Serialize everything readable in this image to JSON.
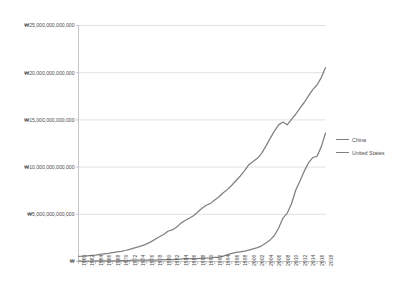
{
  "chart_data": {
    "type": "line",
    "title": "",
    "xlabel": "",
    "ylabel": "",
    "grid": true,
    "legend_position": "right",
    "currency_symbol": "₩",
    "ylim": [
      0,
      25000000000000
    ],
    "ytick_labels": [
      "₩25,000,000,000,000",
      "₩20,000,000,000,000",
      "₩15,000,000,000,000",
      "₩10,000,000,000,000",
      "₩5,000,000,000,000",
      "₩"
    ],
    "ytick_values": [
      25000000000000,
      20000000000000,
      15000000000000,
      10000000000000,
      5000000000000,
      0
    ],
    "xlim": [
      1960,
      2018
    ],
    "xtick_labels": [
      "1960",
      "1962",
      "1964",
      "1966",
      "1968",
      "1970",
      "1972",
      "1974",
      "1976",
      "1978",
      "1980",
      "1982",
      "1984",
      "1986",
      "1988",
      "1990",
      "1992",
      "1994",
      "1996",
      "1998",
      "2000",
      "2002",
      "2004",
      "2006",
      "2008",
      "2010",
      "2012",
      "2014",
      "2016",
      "2018"
    ],
    "x": [
      1960,
      1961,
      1962,
      1963,
      1964,
      1965,
      1966,
      1967,
      1968,
      1969,
      1970,
      1971,
      1972,
      1973,
      1974,
      1975,
      1976,
      1977,
      1978,
      1979,
      1980,
      1981,
      1982,
      1983,
      1984,
      1985,
      1986,
      1987,
      1988,
      1989,
      1990,
      1991,
      1992,
      1993,
      1994,
      1995,
      1996,
      1997,
      1998,
      1999,
      2000,
      2001,
      2002,
      2003,
      2004,
      2005,
      2006,
      2007,
      2008,
      2009,
      2010,
      2011,
      2012,
      2013,
      2014,
      2015,
      2016,
      2017,
      2018
    ],
    "series": [
      {
        "name": "China",
        "color": "#808080",
        "values": [
          59700000000,
          50100000000,
          47200000000,
          50700000000,
          59700000000,
          70400000000,
          76700000000,
          72900000000,
          70800000000,
          79700000000,
          92600000000,
          99800000000,
          113700000000,
          138500000000,
          144200000000,
          163400000000,
          153900000000,
          174900000000,
          149500000000,
          178300000000,
          191100000000,
          195900000000,
          205100000000,
          230700000000,
          259900000000,
          309500000000,
          300800000000,
          272900000000,
          312400000000,
          347800000000,
          360900000000,
          383400000000,
          426900000000,
          444700000000,
          564300000000,
          734500000000,
          863700000000,
          961600000000,
          1025300000000,
          1089500000000,
          1211300000000,
          1339400000000,
          1470600000000,
          1660300000000,
          1955300000000,
          2285900000000,
          2752100000000,
          3550300000000,
          4594300000000,
          5101700000000,
          6087200000000,
          7551500000000,
          8532200000000,
          9570400000000,
          10438500000000,
          11015500000000,
          11137900000000,
          12143500000000,
          13608200000000
        ]
      },
      {
        "name": "United States",
        "color": "#808080",
        "values": [
          543300000000,
          563300000000,
          605100000000,
          638600000000,
          685800000000,
          743700000000,
          815000000000,
          861700000000,
          942500000000,
          1019900000000,
          1073300000000,
          1164900000000,
          1279100000000,
          1425400000000,
          1545200000000,
          1684900000000,
          1873400000000,
          2081800000000,
          2351600000000,
          2627300000000,
          2857300000000,
          3207000000000,
          3343800000000,
          3634000000000,
          4037600000000,
          4339000000000,
          4579600000000,
          4855200000000,
          5236400000000,
          5641600000000,
          5963100000000,
          6158100000000,
          6520300000000,
          6858600000000,
          7287200000000,
          7639700000000,
          8073100000000,
          8577500000000,
          9062800000000,
          9630700000000,
          10252300000000,
          10581800000000,
          10929100000000,
          11456400000000,
          12217200000000,
          13039200000000,
          13815600000000,
          14474200000000,
          14769900000000,
          14478100000000,
          15049000000000,
          15599700000000,
          16254000000000,
          16843200000000,
          17550700000000,
          18206000000000,
          18695100000000,
          19479600000000,
          20544300000000
        ]
      }
    ]
  },
  "legend": {
    "items": [
      {
        "label": "China"
      },
      {
        "label": "United States"
      }
    ]
  }
}
